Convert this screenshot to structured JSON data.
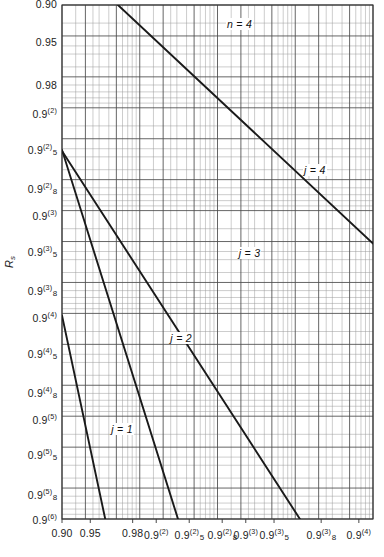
{
  "chart_data": {
    "type": "line",
    "title": "",
    "xlabel": "",
    "ylabel": "Rs",
    "grid": "log-reliability-nines grid, both axes",
    "legend": "inline curve labels",
    "annotation_n": "n = 4",
    "x_tick_labels": [
      {
        "text_main": "0.90",
        "sup": "",
        "sub": "",
        "pos": 0.0
      },
      {
        "text_main": "0.95",
        "sup": "",
        "sub": "",
        "pos": 0.0909
      },
      {
        "text_main": "0.98",
        "sup": "",
        "sub": "",
        "pos": 0.2272
      },
      {
        "text_main": "0.9",
        "sup": "(2)",
        "sub": "",
        "pos": 0.303
      },
      {
        "text_main": "0.9",
        "sup": "(2)",
        "sub": "5",
        "pos": 0.4091
      },
      {
        "text_main": "0.9",
        "sup": "(2)",
        "sub": "8",
        "pos": 0.5151
      },
      {
        "text_main": "0.9",
        "sup": "(3)",
        "sub": "",
        "pos": 0.5909
      },
      {
        "text_main": "0.9",
        "sup": "(3)",
        "sub": "5",
        "pos": 0.6818
      },
      {
        "text_main": "0.9",
        "sup": "(3)",
        "sub": "8",
        "pos": 0.8333
      },
      {
        "text_main": "0.9",
        "sup": "(4)",
        "sub": "",
        "pos": 0.9545
      }
    ],
    "y_tick_labels": [
      {
        "text_main": "0.90",
        "sup": "",
        "sub": "",
        "pos": 0.0
      },
      {
        "text_main": "0.95",
        "sup": "",
        "sub": "",
        "pos": 0.0745
      },
      {
        "text_main": "0.98",
        "sup": "",
        "sub": "",
        "pos": 0.1581
      },
      {
        "text_main": "0.9",
        "sup": "(2)",
        "sub": "",
        "pos": 0.2108
      },
      {
        "text_main": "0.9",
        "sup": "(2)",
        "sub": "5",
        "pos": 0.2799
      },
      {
        "text_main": "0.9",
        "sup": "(2)",
        "sub": "8",
        "pos": 0.3563
      },
      {
        "text_main": "0.9",
        "sup": "(3)",
        "sub": "",
        "pos": 0.409
      },
      {
        "text_main": "0.9",
        "sup": "(3)",
        "sub": "5",
        "pos": 0.4781
      },
      {
        "text_main": "0.9",
        "sup": "(3)",
        "sub": "8",
        "pos": 0.5545
      },
      {
        "text_main": "0.9",
        "sup": "(4)",
        "sub": "",
        "pos": 0.6072
      },
      {
        "text_main": "0.9",
        "sup": "(4)",
        "sub": "5",
        "pos": 0.6763
      },
      {
        "text_main": "0.9",
        "sup": "(4)",
        "sub": "8",
        "pos": 0.7527
      },
      {
        "text_main": "0.9",
        "sup": "(5)",
        "sub": "",
        "pos": 0.8054
      },
      {
        "text_main": "0.9",
        "sup": "(5)",
        "sub": "5",
        "pos": 0.8745
      },
      {
        "text_main": "0.9",
        "sup": "(5)",
        "sub": "8",
        "pos": 0.9509
      },
      {
        "text_main": "0.9",
        "sup": "(6)",
        "sub": "",
        "pos": 1.0
      }
    ],
    "series": [
      {
        "name": "j = 1",
        "label": "j = 1",
        "label_x": 0.155,
        "label_y": 0.827,
        "points": [
          [
            0.0,
            0.604
          ],
          [
            0.139,
            1.0
          ]
        ]
      },
      {
        "name": "j = 2",
        "label": "j = 2",
        "label_x": 0.345,
        "label_y": 0.65,
        "points": [
          [
            0.0,
            0.282
          ],
          [
            0.373,
            1.0
          ]
        ]
      },
      {
        "name": "j = 3",
        "label": "j = 3",
        "label_x": 0.565,
        "label_y": 0.484,
        "points": [
          [
            0.0,
            0.284
          ],
          [
            0.765,
            1.0
          ]
        ]
      },
      {
        "name": "j = 4",
        "label": "j = 4",
        "label_x": 0.775,
        "label_y": 0.323,
        "points": [
          [
            0.18,
            0.0
          ],
          [
            1.0,
            0.464
          ]
        ]
      }
    ],
    "plot_box": {
      "left": 62,
      "top": 5,
      "right": 373,
      "bottom": 519
    },
    "colors": {
      "curve": "#1a1a1a",
      "grid_major": "#4a4a4a",
      "grid_minor": "#9a9a9a",
      "frame": "#333333",
      "background": "#ffffff"
    }
  }
}
